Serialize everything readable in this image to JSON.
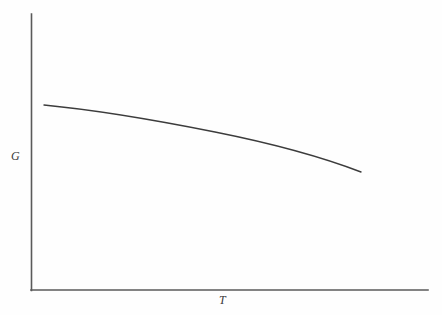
{
  "figure": {
    "background_color": "#fefefe",
    "line_color": "#3c3c3c",
    "axis_color": "#5a5a5a"
  },
  "chart_data": {
    "type": "line",
    "title": "",
    "subtitle": "",
    "xlabel": "T",
    "ylabel": "G",
    "x": [
      0.04,
      0.12,
      0.22,
      0.32,
      0.42,
      0.52,
      0.62,
      0.72,
      0.8,
      0.84
    ],
    "y": [
      0.67,
      0.655,
      0.632,
      0.604,
      0.57,
      0.53,
      0.484,
      0.428,
      0.383,
      0.356
    ],
    "series": [
      {
        "name": "G(T)",
        "values": [
          0.67,
          0.655,
          0.632,
          0.604,
          0.57,
          0.53,
          0.484,
          0.428,
          0.383,
          0.356
        ]
      }
    ],
    "xlim": [
      0,
      1
    ],
    "ylim": [
      0,
      1
    ],
    "xticks": [],
    "yticks": [],
    "xticklabels": [],
    "yticklabels": [],
    "grid": false,
    "legend": false,
    "legend_position": "none",
    "annotations": [],
    "curve_path": "M 44,105 C 96,110 160,121 215,132 C 270,143 322,157 361,172",
    "axis_origin": [
      31,
      290
    ],
    "axis_y_top": 14,
    "axis_x_right": 428
  },
  "labels": {
    "y_axis": "G",
    "x_axis": "T"
  }
}
